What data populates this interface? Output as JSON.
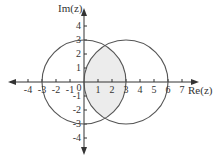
{
  "diagram": {
    "x_axis_label": "Re(z)",
    "y_axis_label": "Im(z)",
    "x_ticks": [
      "-4",
      "-3",
      "-2",
      "-1",
      "0",
      "1",
      "2",
      "3",
      "4",
      "5",
      "6",
      "7"
    ],
    "y_ticks_pos": [
      "1",
      "2",
      "3",
      "4"
    ],
    "y_ticks_neg": [
      "-1",
      "-2",
      "-3",
      "-4"
    ],
    "circles": [
      {
        "center": [
          0,
          0
        ],
        "radius": 3
      },
      {
        "center": [
          3,
          0
        ],
        "radius": 3
      }
    ],
    "shaded_region": "intersection of the two circles",
    "colors": {
      "circle_stroke": "#555555",
      "axis": "#333333",
      "shade": "#ececec"
    }
  }
}
